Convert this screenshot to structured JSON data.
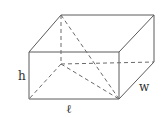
{
  "diagram": {
    "labels": {
      "height": "h",
      "length": "ℓ",
      "width": "w"
    },
    "colors": {
      "edge": "#5a5a5a",
      "hidden_edge": "#6a6a6a",
      "label": "#333333"
    }
  }
}
